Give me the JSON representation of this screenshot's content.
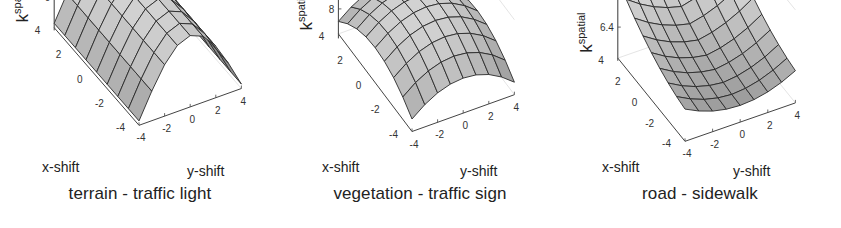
{
  "figure": {
    "panels": [
      {
        "caption": "terrain - traffic light",
        "zlabel": "k",
        "zlabel_sup": "spatial",
        "xlabel": "x-shift",
        "ylabel": "y-shift",
        "exponent": "×10",
        "exponent_power": "-4",
        "z_ticks": [
          "20",
          "0"
        ],
        "x_ticks": [
          "4",
          "2",
          "0",
          "-2",
          "-4"
        ],
        "y_ticks": [
          "-4",
          "-2",
          "0",
          "2",
          "4"
        ]
      },
      {
        "caption": "vegetation - traffic sign",
        "zlabel": "k",
        "zlabel_sup": "spatial",
        "xlabel": "x-shift",
        "ylabel": "y-shift",
        "exponent": "×10",
        "exponent_power": "-4",
        "z_ticks": [
          "9",
          "8"
        ],
        "x_ticks": [
          "4",
          "2",
          "0",
          "-2",
          "-4"
        ],
        "y_ticks": [
          "-4",
          "-2",
          "0",
          "2",
          "4"
        ]
      },
      {
        "caption": "road - sidewalk",
        "zlabel": "k",
        "zlabel_sup": "spatial",
        "xlabel": "x-shift",
        "ylabel": "y-shift",
        "exponent": "×10",
        "exponent_power": "-3",
        "z_ticks": [
          "7.4",
          "6.4"
        ],
        "x_ticks": [
          "4",
          "2",
          "0",
          "-2",
          "-4"
        ],
        "y_ticks": [
          "-4",
          "-2",
          "0",
          "2",
          "4"
        ]
      }
    ]
  },
  "chart_data": [
    {
      "type": "surface",
      "title": "terrain - traffic light",
      "xlabel": "x-shift",
      "ylabel": "y-shift",
      "zlabel": "k^spatial",
      "z_scale": "x10^-4",
      "x": [
        -4,
        -3,
        -2,
        -1,
        0,
        1,
        2,
        3,
        4
      ],
      "y": [
        -4,
        -3,
        -2,
        -1,
        0,
        1,
        2,
        3,
        4
      ],
      "zlim": [
        -5,
        20
      ],
      "z_ticks": [
        0,
        20
      ],
      "shape": "ridge along x, peaked at y=0, falling toward y=±4",
      "z_at_center": 20,
      "z_at_y_edges": -5
    },
    {
      "type": "surface",
      "title": "vegetation - traffic sign",
      "xlabel": "x-shift",
      "ylabel": "y-shift",
      "zlabel": "k^spatial",
      "z_scale": "x10^-4",
      "x": [
        -4,
        -3,
        -2,
        -1,
        0,
        1,
        2,
        3,
        4
      ],
      "y": [
        -4,
        -3,
        -2,
        -1,
        0,
        1,
        2,
        3,
        4
      ],
      "zlim": [
        7.5,
        9
      ],
      "z_ticks": [
        8,
        9
      ],
      "shape": "dome peaked at (0,0)",
      "z_at_center": 9,
      "z_at_corners": 7.5
    },
    {
      "type": "surface",
      "title": "road - sidewalk",
      "xlabel": "x-shift",
      "ylabel": "y-shift",
      "zlabel": "k^spatial",
      "z_scale": "x10^-3",
      "x": [
        -4,
        -3,
        -2,
        -1,
        0,
        1,
        2,
        3,
        4
      ],
      "y": [
        -4,
        -3,
        -2,
        -1,
        0,
        1,
        2,
        3,
        4
      ],
      "zlim": [
        6.4,
        7.6
      ],
      "z_ticks": [
        6.4,
        7.4
      ],
      "shape": "bowl / saddle with minimum near (0,0), rising toward x=4 corners",
      "z_at_center": 6.4,
      "z_max_corner": 7.6
    }
  ]
}
